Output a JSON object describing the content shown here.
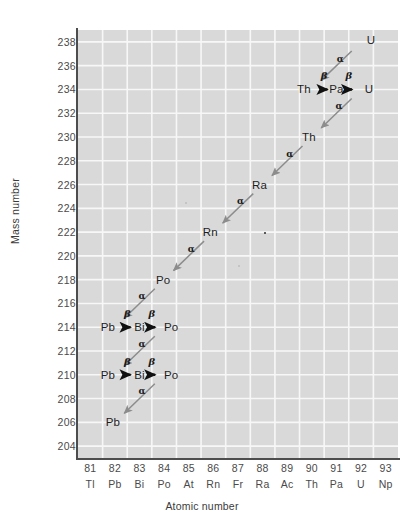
{
  "chart_data": {
    "type": "scatter",
    "title": "",
    "xlabel": "Atomic number",
    "ylabel": "Mass number",
    "grid": true,
    "legend": "none",
    "xlim": [
      80.5,
      93.5
    ],
    "ylim": [
      203,
      239
    ],
    "x_ticks": [
      81,
      82,
      83,
      84,
      85,
      86,
      87,
      88,
      89,
      90,
      91,
      92,
      93
    ],
    "x_tick_symbols": [
      "Tl",
      "Pb",
      "Bi",
      "Po",
      "At",
      "Rn",
      "Fr",
      "Ra",
      "Ac",
      "Th",
      "Pa",
      "U",
      "Np"
    ],
    "y_ticks": [
      238,
      236,
      234,
      232,
      230,
      228,
      226,
      224,
      222,
      220,
      218,
      216,
      214,
      212,
      210,
      208,
      206,
      204
    ],
    "nuclides": [
      {
        "label": "U",
        "z": 92,
        "a": 238,
        "offset_x": 10,
        "offset_y": -2
      },
      {
        "label": "Th",
        "z": 90,
        "a": 234,
        "offset_x": -8,
        "offset_y": 0
      },
      {
        "label": "Pa",
        "z": 91,
        "a": 234,
        "offset_x": 0,
        "offset_y": 0
      },
      {
        "label": "U",
        "z": 92,
        "a": 234,
        "offset_x": 8,
        "offset_y": 0
      },
      {
        "label": "Th",
        "z": 90,
        "a": 230,
        "offset_x": -3,
        "offset_y": 0
      },
      {
        "label": "Ra",
        "z": 88,
        "a": 226,
        "offset_x": -3,
        "offset_y": 0
      },
      {
        "label": "Rn",
        "z": 86,
        "a": 222,
        "offset_x": -3,
        "offset_y": 0
      },
      {
        "label": "Po",
        "z": 84,
        "a": 218,
        "offset_x": -1,
        "offset_y": 0
      },
      {
        "label": "Pb",
        "z": 82,
        "a": 214,
        "offset_x": -7,
        "offset_y": 0
      },
      {
        "label": "Bi",
        "z": 83,
        "a": 214,
        "offset_x": 0,
        "offset_y": 0
      },
      {
        "label": "Po",
        "z": 84,
        "a": 214,
        "offset_x": 7,
        "offset_y": 0
      },
      {
        "label": "Pb",
        "z": 82,
        "a": 210,
        "offset_x": -7,
        "offset_y": 0
      },
      {
        "label": "Bi",
        "z": 83,
        "a": 210,
        "offset_x": 0,
        "offset_y": 0
      },
      {
        "label": "Po",
        "z": 84,
        "a": 210,
        "offset_x": 7,
        "offset_y": 0
      },
      {
        "label": "Pb",
        "z": 82,
        "a": 206,
        "offset_x": -2,
        "offset_y": 0
      }
    ],
    "decays": [
      {
        "type": "alpha",
        "label": "α",
        "from_z": 92,
        "from_a": 238,
        "to_z": 90,
        "to_a": 234,
        "label_x": 91.15,
        "label_y": 236.6
      },
      {
        "type": "beta",
        "label": "β",
        "from_z": 90,
        "from_a": 234,
        "to_z": 91,
        "to_a": 234,
        "label_x": 90.5,
        "label_y": 235.2
      },
      {
        "type": "beta",
        "label": "β",
        "from_z": 91,
        "from_a": 234,
        "to_z": 92,
        "to_a": 234,
        "label_x": 91.5,
        "label_y": 235.2
      },
      {
        "type": "alpha",
        "label": "α",
        "from_z": 92,
        "from_a": 234,
        "to_z": 90,
        "to_a": 230,
        "label_x": 91.1,
        "label_y": 232.6
      },
      {
        "type": "alpha",
        "label": "α",
        "from_z": 90,
        "from_a": 230,
        "to_z": 88,
        "to_a": 226,
        "label_x": 89.1,
        "label_y": 228.6
      },
      {
        "type": "alpha",
        "label": "α",
        "from_z": 88,
        "from_a": 226,
        "to_z": 86,
        "to_a": 222,
        "label_x": 87.1,
        "label_y": 224.6
      },
      {
        "type": "alpha",
        "label": "α",
        "from_z": 86,
        "from_a": 222,
        "to_z": 84,
        "to_a": 218,
        "label_x": 85.1,
        "label_y": 220.6
      },
      {
        "type": "alpha",
        "label": "α",
        "from_z": 84,
        "from_a": 218,
        "to_z": 82,
        "to_a": 214,
        "label_x": 83.1,
        "label_y": 216.6
      },
      {
        "type": "beta",
        "label": "β",
        "from_z": 82,
        "from_a": 214,
        "to_z": 83,
        "to_a": 214,
        "label_x": 82.5,
        "label_y": 215.2
      },
      {
        "type": "beta",
        "label": "β",
        "from_z": 83,
        "from_a": 214,
        "to_z": 84,
        "to_a": 214,
        "label_x": 83.5,
        "label_y": 215.2
      },
      {
        "type": "alpha",
        "label": "α",
        "from_z": 84,
        "from_a": 214,
        "to_z": 82,
        "to_a": 210,
        "label_x": 83.1,
        "label_y": 212.6
      },
      {
        "type": "beta",
        "label": "β",
        "from_z": 82,
        "from_a": 210,
        "to_z": 83,
        "to_a": 210,
        "label_x": 82.5,
        "label_y": 211.2
      },
      {
        "type": "beta",
        "label": "β",
        "from_z": 83,
        "from_a": 210,
        "to_z": 84,
        "to_a": 210,
        "label_x": 83.5,
        "label_y": 211.2
      },
      {
        "type": "alpha",
        "label": "α",
        "from_z": 84,
        "from_a": 210,
        "to_z": 82,
        "to_a": 206,
        "label_x": 83.1,
        "label_y": 208.6
      }
    ],
    "artifacts": [
      {
        "z": 88.05,
        "a": 222.0,
        "faint": false
      },
      {
        "z": 87.0,
        "a": 219.2,
        "faint": true
      },
      {
        "z": 84.85,
        "a": 224.5,
        "faint": true
      }
    ],
    "colors": {
      "plot_background": "#d9d9d9",
      "gridline": "#f7f7f7",
      "axis": "#4d4d4d",
      "alpha_arrow": "#8c8c8c",
      "beta_arrow": "#111111",
      "text": "#1e1e1e",
      "tick_text": "#4a4a4a"
    }
  }
}
